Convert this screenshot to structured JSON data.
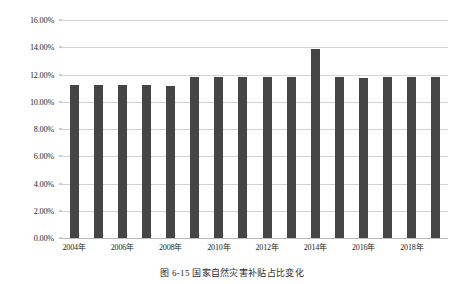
{
  "figure": {
    "caption": "图 6-15  国家自然灾害补贴占比变化"
  },
  "chart_data": {
    "type": "bar",
    "title": "",
    "xlabel": "",
    "ylabel": "",
    "categories": [
      "2004年",
      "2005年",
      "2006年",
      "2007年",
      "2008年",
      "2009年",
      "2010年",
      "2011年",
      "2012年",
      "2013年",
      "2014年",
      "2015年",
      "2016年",
      "2017年",
      "2018年",
      "2019年"
    ],
    "values": [
      11.25,
      11.25,
      11.22,
      11.2,
      11.18,
      11.85,
      11.82,
      11.83,
      11.85,
      11.83,
      13.85,
      11.8,
      11.78,
      11.82,
      11.8,
      11.85
    ],
    "ylim": [
      0,
      16
    ],
    "ytick_labels": [
      "0.00%",
      "2.00%",
      "4.00%",
      "6.00%",
      "8.00%",
      "10.00%",
      "12.00%",
      "14.00%",
      "16.00%"
    ],
    "ytick_values": [
      0,
      2,
      4,
      6,
      8,
      10,
      12,
      14,
      16
    ],
    "xtick_labels": [
      "2004年",
      "2006年",
      "2008年",
      "2010年",
      "2012年",
      "2014年",
      "2016年",
      "2018年"
    ],
    "xtick_indices": [
      0,
      2,
      4,
      6,
      8,
      10,
      12,
      14
    ],
    "grid": true,
    "legend": "none",
    "bar_color": "#454545",
    "gridline_color": "#d2d2d2",
    "background": "#ffffff"
  }
}
